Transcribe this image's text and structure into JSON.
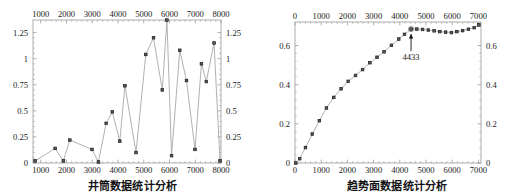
{
  "figure": {
    "panels": [
      {
        "id": "left",
        "caption": "井筒数据统计分析",
        "chart_index": 0
      },
      {
        "id": "right",
        "caption": "趋势面数据统计分析",
        "chart_index": 1
      }
    ]
  },
  "style": {
    "frame_color": "#9a9a9a",
    "line_color": "#a8a8a8",
    "marker_fill": "#5a5a5a",
    "marker_edge": "#1a1a1a",
    "text_color": "#1a1a1a",
    "background": "#ffffff"
  },
  "chart_data": [
    {
      "type": "line",
      "title": "",
      "caption": "井筒数据统计分析",
      "xlabel": "",
      "ylabel": "",
      "xlim": [
        700,
        8000
      ],
      "ylim": [
        0,
        1.37
      ],
      "grid": false,
      "legend": null,
      "markers": "square",
      "axes": {
        "top_ticks": [
          1000,
          2000,
          3000,
          4000,
          5000,
          6000,
          7000,
          8000
        ],
        "bottom_ticks": [
          1000,
          2000,
          3000,
          4000,
          5000,
          6000,
          7000,
          8000
        ],
        "left_ticks": [
          0,
          0.25,
          0.5,
          0.75,
          1,
          1.25
        ],
        "right_ticks": [
          0,
          0.25,
          0.5,
          0.75,
          1,
          1.25
        ],
        "top_tick_labels": [
          "1000",
          "2000",
          "3000",
          "4000",
          "5000",
          "6000",
          "7000",
          "8000"
        ],
        "bottom_tick_labels": [
          "1000",
          "2000",
          "3000",
          "4000",
          "5000",
          "6000",
          "7000",
          "8000"
        ],
        "left_tick_labels": [
          "0",
          "0.25",
          "0.5",
          "0.75",
          "1",
          "1.25"
        ],
        "right_tick_labels": [
          "0",
          "0.25",
          "0.5",
          "0.75",
          "1",
          "1.25"
        ]
      },
      "x": [
        780,
        1560,
        1880,
        2130,
        2990,
        3240,
        3540,
        3780,
        4070,
        4270,
        4700,
        5080,
        5380,
        5720,
        5900,
        6080,
        6400,
        6660,
        6990,
        7240,
        7430,
        7730,
        7960
      ],
      "values": [
        0.02,
        0.14,
        0.02,
        0.22,
        0.13,
        0.01,
        0.38,
        0.49,
        0.21,
        0.74,
        0.1,
        1.04,
        1.2,
        0.7,
        1.37,
        0.07,
        1.08,
        0.79,
        0.13,
        0.95,
        0.78,
        1.15,
        0.02
      ]
    },
    {
      "type": "line",
      "title": "",
      "caption": "趋势面数据统计分析",
      "xlabel": "",
      "ylabel": "",
      "xlim": [
        0,
        7100
      ],
      "ylim": [
        0,
        0.72
      ],
      "grid": false,
      "legend": null,
      "markers": "square",
      "axes": {
        "top_ticks": [
          0,
          1000,
          2000,
          3000,
          4000,
          5000,
          6000,
          7000
        ],
        "bottom_ticks": [
          0,
          1000,
          2000,
          3000,
          4000,
          5000,
          6000,
          7000
        ],
        "left_ticks": [
          0,
          0.2,
          0.4,
          0.6
        ],
        "right_ticks": [
          0,
          0.2,
          0.4,
          0.6
        ],
        "top_tick_labels": [
          "0",
          "1000",
          "2000",
          "3000",
          "4000",
          "5000",
          "6000",
          "7000"
        ],
        "bottom_tick_labels": [
          "0",
          "1000",
          "2000",
          "3000",
          "4000",
          "5000",
          "6000",
          "7000"
        ],
        "left_tick_labels": [
          "0",
          "0.2",
          "0.4",
          "0.6"
        ],
        "right_tick_labels": [
          "0",
          "0.2",
          "0.4",
          "0.6"
        ]
      },
      "x": [
        30,
        180,
        400,
        660,
        930,
        1200,
        1480,
        1760,
        2030,
        2310,
        2580,
        2860,
        3130,
        3400,
        3680,
        3960,
        4180,
        4430,
        4650,
        4870,
        5090,
        5310,
        5530,
        5750,
        5970,
        6180,
        6400,
        6620,
        6840,
        7020
      ],
      "values": [
        0.0,
        0.022,
        0.079,
        0.148,
        0.216,
        0.281,
        0.335,
        0.379,
        0.417,
        0.447,
        0.477,
        0.512,
        0.54,
        0.568,
        0.601,
        0.633,
        0.657,
        0.684,
        0.684,
        0.682,
        0.679,
        0.675,
        0.671,
        0.668,
        0.666,
        0.671,
        0.676,
        0.683,
        0.691,
        0.705
      ],
      "annotations": [
        {
          "label": "4433",
          "x": 4430,
          "y": 0.684,
          "arrow": "up",
          "name": "peak-annotation"
        }
      ]
    }
  ]
}
